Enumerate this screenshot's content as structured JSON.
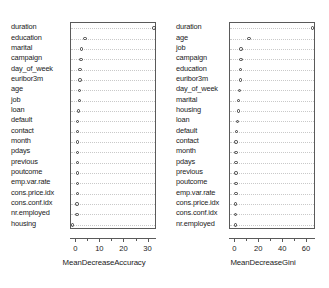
{
  "chart_data": {
    "type": "scatter",
    "title": "",
    "layout": "two-panel dotchart (randomForest varImpPlot)",
    "grid": true,
    "legend": null,
    "panels": [
      {
        "name": "MeanDecreaseAccuracy",
        "xlabel": "MeanDecreaseAccuracy",
        "xlim": [
          -2.2,
          33.5
        ],
        "xticks": [
          0,
          10,
          20,
          30
        ],
        "xticklabels": [
          "0",
          "10",
          "20",
          "30"
        ],
        "minor_xticks": [
          5,
          15,
          25
        ],
        "categories": [
          "duration",
          "education",
          "marital",
          "campaign",
          "day_of_week",
          "euribor3m",
          "age",
          "job",
          "loan",
          "default",
          "contact",
          "month",
          "pdays",
          "previous",
          "poutcome",
          "emp.var.rate",
          "cons.price.idx",
          "cons.conf.idx",
          "nr.employed",
          "housing"
        ],
        "values": [
          32.2,
          3.6,
          2.1,
          2.0,
          1.6,
          1.6,
          1.3,
          1.2,
          0.9,
          0.6,
          0.6,
          0.5,
          0.5,
          0.5,
          0.4,
          0.4,
          0.4,
          0.3,
          0.3,
          -1.7
        ]
      },
      {
        "name": "MeanDecreaseGini",
        "xlabel": "MeanDecreaseGini",
        "xlim": [
          -4.5,
          67.5
        ],
        "xticks": [
          0,
          20,
          40,
          60
        ],
        "xticklabels": [
          "0",
          "20",
          "40",
          "60"
        ],
        "minor_xticks": [
          10,
          30,
          50
        ],
        "categories": [
          "duration",
          "age",
          "job",
          "campaign",
          "education",
          "euribor3m",
          "day_of_week",
          "marital",
          "housing",
          "loan",
          "default",
          "contact",
          "month",
          "pdays",
          "previous",
          "poutcome",
          "emp.var.rate",
          "cons.price.idx",
          "cons.conf.idx",
          "nr.employed"
        ],
        "values": [
          64.5,
          11.5,
          4.8,
          4.6,
          4.5,
          4.3,
          3.6,
          2.8,
          2.6,
          1.9,
          0.7,
          0.6,
          0.5,
          0.5,
          0.4,
          0.4,
          0.4,
          0.3,
          0.3,
          0.3
        ]
      }
    ]
  }
}
